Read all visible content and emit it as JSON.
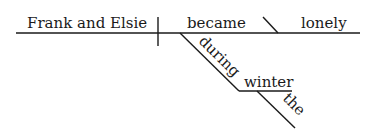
{
  "diagram": {
    "type": "sentence-diagram",
    "sentence": "Frank and Elsie became lonely during the winter",
    "subject": "Frank and Elsie",
    "verb": "became",
    "complement": "lonely",
    "modifier": {
      "preposition": "during",
      "object": "winter",
      "article": "the"
    }
  }
}
